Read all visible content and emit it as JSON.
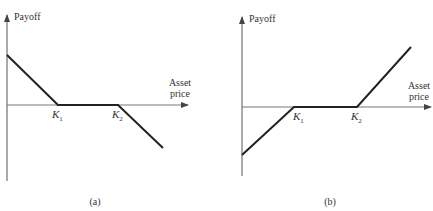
{
  "figure": {
    "top_cut_text": "",
    "panels": [
      {
        "id": "a",
        "caption": "(a)",
        "y_axis_label": "Payoff",
        "x_axis_label_line1": "Asset",
        "x_axis_label_line2": "price",
        "strike_labels": [
          {
            "base": "K",
            "sub": "1"
          },
          {
            "base": "K",
            "sub": "2"
          }
        ],
        "description": "Payoff decreasing to zero at K1, flat zero between K1 and K2, decreasing below zero after K2"
      },
      {
        "id": "b",
        "caption": "(b)",
        "y_axis_label": "Payoff",
        "x_axis_label_line1": "Asset",
        "x_axis_label_line2": "price",
        "strike_labels": [
          {
            "base": "K",
            "sub": "1"
          },
          {
            "base": "K",
            "sub": "2"
          }
        ],
        "description": "Payoff negative rising to zero at K1, flat zero between K1 and K2, rising above zero after K2"
      }
    ]
  },
  "colors": {
    "axis": "#555555",
    "payoff_line": "#222222",
    "text": "#333333"
  }
}
